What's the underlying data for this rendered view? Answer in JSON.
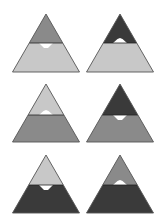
{
  "colors": {
    "light": "#c8c8c8",
    "medium": "#8a8a8a",
    "dark": "#3a3a3a",
    "notch": "#ffffff",
    "outline": "#555555",
    "background": "#ffffff"
  },
  "geometry": {
    "half_base": 33.5,
    "height": 58,
    "notch_half_width": 7,
    "notch_depth": 5
  },
  "triangles": [
    {
      "id": "t1",
      "apex_x": 46,
      "apex_y": 14,
      "boundary_y": 43,
      "top_fill": "medium",
      "bottom_fill": "light",
      "notch": "down"
    },
    {
      "id": "t2",
      "apex_x": 120,
      "apex_y": 14,
      "boundary_y": 43,
      "top_fill": "dark",
      "bottom_fill": "light",
      "notch": "up"
    },
    {
      "id": "t3",
      "apex_x": 46,
      "apex_y": 84,
      "boundary_y": 115,
      "top_fill": "light",
      "bottom_fill": "medium",
      "notch": "up"
    },
    {
      "id": "t4",
      "apex_x": 120,
      "apex_y": 84,
      "boundary_y": 115,
      "top_fill": "dark",
      "bottom_fill": "medium",
      "notch": "down"
    },
    {
      "id": "t5",
      "apex_x": 46,
      "apex_y": 155,
      "boundary_y": 185,
      "top_fill": "light",
      "bottom_fill": "dark",
      "notch": "down"
    },
    {
      "id": "t6",
      "apex_x": 120,
      "apex_y": 155,
      "boundary_y": 185,
      "top_fill": "medium",
      "bottom_fill": "dark",
      "notch": "up"
    }
  ]
}
